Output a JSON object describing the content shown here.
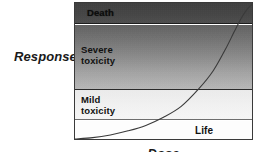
{
  "figure": {
    "y_axis_title": "Response",
    "x_axis_title": "Dose",
    "bands": [
      {
        "id": "death",
        "label": "Death"
      },
      {
        "id": "severe",
        "label": "Severe\ntoxicity"
      },
      {
        "id": "mild",
        "label": "Mild\ntoxicity"
      },
      {
        "id": "life",
        "label": "Life"
      }
    ],
    "colors": {
      "death_fill": "#414141",
      "severe_fill_top": "#5e5e5e",
      "severe_fill_bottom": "#bdbdbd",
      "mild_fill": "#f2f2f2",
      "life_fill": "#fdfdfd",
      "border": "#3a3a3a",
      "curve": "#3a3a3a",
      "text": "#111111"
    }
  },
  "chart_data": {
    "type": "line",
    "title": "",
    "xlabel": "Dose",
    "ylabel": "Response",
    "xlim": [
      0,
      100
    ],
    "ylim": [
      0,
      100
    ],
    "grid": false,
    "legend": "none",
    "axis_ticks": {
      "x": [],
      "y": []
    },
    "bands": [
      {
        "label": "Death",
        "y_range": [
          85,
          100
        ],
        "fill": "#414141"
      },
      {
        "label": "Severe toxicity",
        "y_range": [
          38,
          85
        ],
        "fill": "#8a8a8a"
      },
      {
        "label": "Mild toxicity",
        "y_range": [
          16,
          38
        ],
        "fill": "#f2f2f2"
      },
      {
        "label": "Life",
        "y_range": [
          0,
          16
        ],
        "fill": "#fdfdfd"
      }
    ],
    "series": [
      {
        "name": "dose-response curve",
        "x": [
          0,
          10,
          20,
          30,
          40,
          50,
          60,
          70,
          78,
          85,
          90,
          94,
          97,
          100
        ],
        "y": [
          0,
          1,
          3,
          6,
          10,
          16,
          24,
          37,
          50,
          66,
          79,
          89,
          95,
          99
        ]
      }
    ],
    "annotations": [
      {
        "text": "Death",
        "x": 8,
        "y": 93
      },
      {
        "text": "Severe toxicity",
        "x": 5,
        "y": 63
      },
      {
        "text": "Mild toxicity",
        "x": 5,
        "y": 29
      },
      {
        "text": "Life",
        "x": 70,
        "y": 8
      }
    ]
  }
}
